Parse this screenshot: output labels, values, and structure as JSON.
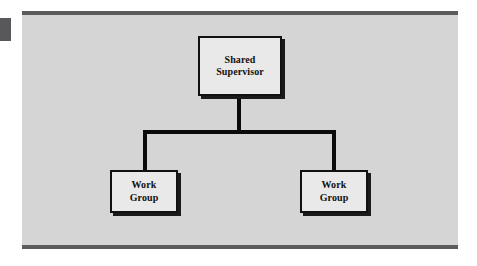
{
  "figure": {
    "type": "organization-chart",
    "orientation": "top-down",
    "background_color": "#d5d5d5",
    "page_color": "#ffffff",
    "rule_color": "#5c5c5e",
    "box_fill_color": "#e9e9e9",
    "box_border_color": "#111111",
    "connector_color": "#0b0b0b"
  },
  "nodes": [
    {
      "id": "supervisor",
      "label": "Shared Supervisor",
      "line1": "Shared",
      "line2": "Supervisor",
      "level": 0
    },
    {
      "id": "work-group-left",
      "label": "Work Group",
      "line1": "Work",
      "line2": "Group",
      "level": 1
    },
    {
      "id": "work-group-right",
      "label": "Work Group",
      "line1": "Work",
      "line2": "Group",
      "level": 1
    }
  ],
  "edges": [
    {
      "from": "supervisor",
      "to": "work-group-left"
    },
    {
      "from": "supervisor",
      "to": "work-group-right"
    }
  ]
}
